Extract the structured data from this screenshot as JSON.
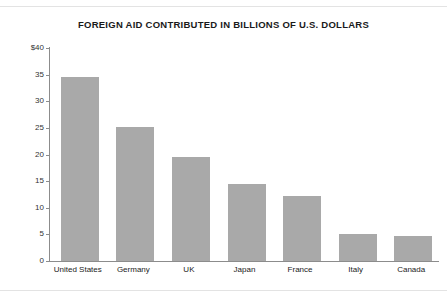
{
  "chart_data": {
    "type": "bar",
    "title": "FOREIGN AID CONTRIBUTED IN BILLIONS OF U.S. DOLLARS",
    "xlabel": "",
    "ylabel": "",
    "categories": [
      "United States",
      "Germany",
      "UK",
      "Japan",
      "France",
      "Italy",
      "Canada"
    ],
    "values": [
      34.6,
      25.2,
      19.6,
      14.4,
      12.3,
      5.0,
      4.7
    ],
    "series": [
      {
        "name": "Foreign aid contributed",
        "values": [
          34.6,
          25.2,
          19.6,
          14.4,
          12.3,
          5.0,
          4.7
        ]
      }
    ],
    "ylim": [
      0,
      40
    ],
    "ytick_labels": [
      "$40",
      "35",
      "30",
      "25",
      "20",
      "15",
      "10",
      "5",
      "0"
    ],
    "ytick_values": [
      40,
      35,
      30,
      25,
      20,
      15,
      10,
      5,
      0
    ],
    "grid": false,
    "legend": false,
    "legend_position": "none",
    "bar_color": "#a9a9a9",
    "axis_color": "#8c8c8c",
    "title_color": "#1a1a1a",
    "background_color": "#ffffff"
  }
}
